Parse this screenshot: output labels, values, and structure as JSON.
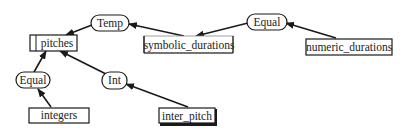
{
  "diagram": {
    "type": "data-type dependency graph",
    "colors": {
      "stroke": "#1a1a1a",
      "background": "#ffffff",
      "text": "#222222"
    },
    "nodes": {
      "pitches": {
        "label": "pitches",
        "shape": "box"
      },
      "temp": {
        "label": "Temp",
        "shape": "oval"
      },
      "symbolic_durations": {
        "label": "symbolic_durations",
        "shape": "box"
      },
      "equal_top": {
        "label": "Equal",
        "shape": "oval"
      },
      "numeric_durations": {
        "label": "numeric_durations",
        "shape": "box"
      },
      "equal_left": {
        "label": "Equal",
        "shape": "oval"
      },
      "integers": {
        "label": "integers",
        "shape": "box"
      },
      "int": {
        "label": "Int",
        "shape": "oval"
      },
      "inter_pitch": {
        "label": "inter_pitch",
        "shape": "box"
      }
    },
    "edges": [
      {
        "from": "Temp",
        "to": "pitches"
      },
      {
        "from": "symbolic_durations",
        "to": "Temp"
      },
      {
        "from": "Equal",
        "to": "symbolic_durations"
      },
      {
        "from": "numeric_durations",
        "to": "Equal"
      },
      {
        "from": "Equal",
        "to": "pitches"
      },
      {
        "from": "integers",
        "to": "Equal"
      },
      {
        "from": "Int",
        "to": "pitches"
      },
      {
        "from": "inter_pitch",
        "to": "Int"
      }
    ]
  }
}
